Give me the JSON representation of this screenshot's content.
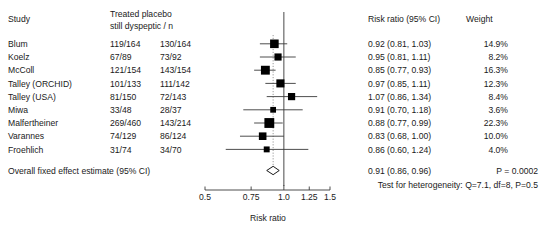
{
  "headers": {
    "study": "Study",
    "counts_line1": "Treated placebo",
    "counts_line2": "still dyspeptic / n",
    "risk_ratio": "Risk ratio (95% CI)",
    "weight": "Weight"
  },
  "overall_label": "Overall fixed effect estimate (95% CI)",
  "overall_rr_text": "0.91 (0.86, 0.96)",
  "overall_p": "P = 0.0002",
  "heterogeneity": "Test for heterogeneity: Q=7.1, df=8, P=0.5",
  "axis_title": "Risk ratio",
  "chart_data": {
    "type": "forest",
    "title": "",
    "xlabel": "Risk ratio",
    "ylabel": "",
    "xscale": "log",
    "xlim": [
      0.5,
      1.5
    ],
    "xticks": [
      0.5,
      0.75,
      1.0,
      1.25,
      1.5
    ],
    "xtick_labels": [
      "0.5",
      "0.75",
      "1.0",
      "1.25",
      "1.5"
    ],
    "grid": false,
    "null_line": 1.0,
    "pooled_line": 0.91,
    "columns": [
      "Study",
      "Treated still dyspeptic / n",
      "placebo still dyspeptic / n",
      "Risk ratio (95% CI)",
      "Weight"
    ],
    "studies": [
      {
        "study": "Blum",
        "treated": "119/164",
        "placebo": "130/164",
        "rr_text": "0.92 (0.81, 1.03)",
        "rr": 0.92,
        "lo": 0.81,
        "hi": 1.03,
        "weight_text": "14.9%",
        "weight": 14.9
      },
      {
        "study": "Koelz",
        "treated": "67/89",
        "placebo": "73/92",
        "rr_text": "0.95 (0.81, 1.11)",
        "rr": 0.95,
        "lo": 0.81,
        "hi": 1.11,
        "weight_text": "8.2%",
        "weight": 8.2
      },
      {
        "study": "McColl",
        "treated": "121/154",
        "placebo": "143/154",
        "rr_text": "0.85 (0.77, 0.93)",
        "rr": 0.85,
        "lo": 0.77,
        "hi": 0.93,
        "weight_text": "16.3%",
        "weight": 16.3
      },
      {
        "study": "Talley (ORCHID)",
        "treated": "101/133",
        "placebo": "111/142",
        "rr_text": "0.97 (0.85, 1.11)",
        "rr": 0.97,
        "lo": 0.85,
        "hi": 1.11,
        "weight_text": "12.3%",
        "weight": 12.3
      },
      {
        "study": "Talley (USA)",
        "treated": "81/150",
        "placebo": "72/143",
        "rr_text": "1.07 (0.86, 1.34)",
        "rr": 1.07,
        "lo": 0.86,
        "hi": 1.34,
        "weight_text": "8.4%",
        "weight": 8.4
      },
      {
        "study": "Miwa",
        "treated": "33/48",
        "placebo": "28/37",
        "rr_text": "0.91 (0.70, 1.18)",
        "rr": 0.91,
        "lo": 0.7,
        "hi": 1.18,
        "weight_text": "3.6%",
        "weight": 3.6
      },
      {
        "study": "Malfertheiner",
        "treated": "269/460",
        "placebo": "143/214",
        "rr_text": "0.88 (0.77, 0.99)",
        "rr": 0.88,
        "lo": 0.77,
        "hi": 0.99,
        "weight_text": "22.3%",
        "weight": 22.3
      },
      {
        "study": "Varannes",
        "treated": "74/129",
        "placebo": "86/124",
        "rr_text": "0.83 (0.68, 1.00)",
        "rr": 0.83,
        "lo": 0.68,
        "hi": 1.0,
        "weight_text": "10.0%",
        "weight": 10.0
      },
      {
        "study": "Froehlich",
        "treated": "31/74",
        "placebo": "34/70",
        "rr_text": "0.86 (0.60, 1.24)",
        "rr": 0.86,
        "lo": 0.6,
        "hi": 1.24,
        "weight_text": "4.0%",
        "weight": 4.0
      }
    ],
    "overall": {
      "label": "Overall fixed effect estimate (95% CI)",
      "rr_text": "0.91 (0.86, 0.96)",
      "rr": 0.91,
      "lo": 0.86,
      "hi": 0.96,
      "p": "P = 0.0002"
    },
    "annotations": [
      "Test for heterogeneity: Q=7.1, df=8, P=0.5"
    ]
  }
}
